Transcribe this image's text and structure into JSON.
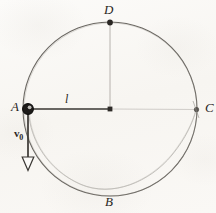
{
  "figure": {
    "kind": "physics-circular-motion-diagram",
    "background_color": "#fbfaf8",
    "ink_color": "#2a2724",
    "faint_ink_color": "#b9b6b0",
    "labels": {
      "point_a": "A",
      "point_b": "B",
      "point_c": "C",
      "point_d": "D",
      "radius": "l",
      "velocity": "v",
      "velocity_subscript": "0"
    },
    "geometry": {
      "center_x": 110,
      "center_y": 109,
      "radius": 87,
      "point_a": [
        28,
        109
      ],
      "point_b": [
        110,
        196
      ],
      "point_c": [
        197,
        109
      ],
      "point_d": [
        110,
        22
      ],
      "arrow_tail": [
        28,
        112
      ],
      "arrow_tip": [
        28,
        168
      ]
    }
  }
}
